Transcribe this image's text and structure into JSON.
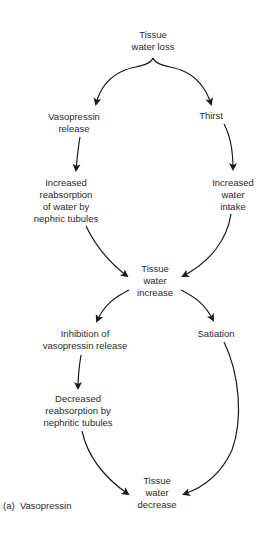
{
  "diagram": {
    "caption": "(a)  Vasopressin",
    "nodes": {
      "tissue_water_loss": "Tissue\nwater loss",
      "vasopressin_release": "Vasopressin\nrelease",
      "thirst": "Thirst",
      "increased_reabsorption": "Increased\nreabsorption\nof water by\nnephric tubules",
      "increased_water_intake": "Increased\nwater\nintake",
      "tissue_water_increase": "Tissue\nwater\nincrease",
      "inhibition_vasopressin": "Inhibition of\nvasopressin release",
      "satiation": "Satiation",
      "decreased_reabsorption": "Decreased\nreabsorption by\nnephritic tubules",
      "tissue_water_decrease": "Tissue\nwater\ndecrease"
    },
    "edges": [
      {
        "from": "tissue_water_loss",
        "to": "vasopressin_release"
      },
      {
        "from": "tissue_water_loss",
        "to": "thirst"
      },
      {
        "from": "vasopressin_release",
        "to": "increased_reabsorption"
      },
      {
        "from": "thirst",
        "to": "increased_water_intake"
      },
      {
        "from": "increased_reabsorption",
        "to": "tissue_water_increase"
      },
      {
        "from": "increased_water_intake",
        "to": "tissue_water_increase"
      },
      {
        "from": "tissue_water_increase",
        "to": "inhibition_vasopressin"
      },
      {
        "from": "tissue_water_increase",
        "to": "satiation"
      },
      {
        "from": "inhibition_vasopressin",
        "to": "decreased_reabsorption"
      },
      {
        "from": "decreased_reabsorption",
        "to": "tissue_water_decrease"
      },
      {
        "from": "satiation",
        "to": "tissue_water_decrease"
      }
    ]
  }
}
